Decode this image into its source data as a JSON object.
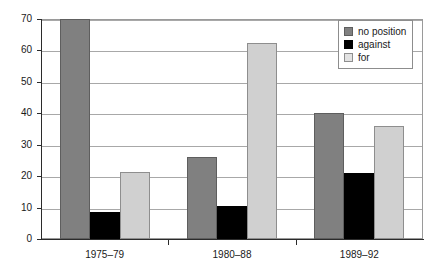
{
  "chart_data": {
    "type": "bar",
    "title": "",
    "subtitle": "",
    "xlabel": "",
    "ylabel": "",
    "categories": [
      "1975–79",
      "1980–88",
      "1989–92"
    ],
    "series": [
      {
        "name": "no position",
        "color": "#808080",
        "values": [
          70,
          26,
          40
        ]
      },
      {
        "name": "against",
        "color": "#000000",
        "values": [
          8.6,
          10.4,
          21
        ]
      },
      {
        "name": "for",
        "color": "#d0d0d0",
        "values": [
          21.4,
          62.4,
          36
        ]
      }
    ],
    "ylim": [
      0,
      70
    ],
    "ytick_step": 10,
    "yticks": [
      0,
      10,
      20,
      30,
      40,
      50,
      60,
      70
    ],
    "ytick_labels": [
      "0",
      "10",
      "20",
      "30",
      "40",
      "50",
      "60",
      "70"
    ],
    "xtick_labels": [
      "1975–79",
      "1980–88",
      "1989–92"
    ],
    "grid": true,
    "grid_axis": "y",
    "legend": {
      "position": "top-right",
      "entries": [
        "no position",
        "against",
        "for"
      ]
    }
  },
  "legend": {
    "items": [
      {
        "label": "no position",
        "swatch": "legend-swatch-no-position"
      },
      {
        "label": "against",
        "swatch": "legend-swatch-against"
      },
      {
        "label": "for",
        "swatch": "legend-swatch-for"
      }
    ]
  },
  "axes": {
    "y": {
      "labels": [
        "70",
        "60",
        "50",
        "40",
        "30",
        "20",
        "10",
        "0"
      ]
    },
    "x": {
      "labels": [
        "1975–79",
        "1980–88",
        "1989–92"
      ]
    }
  }
}
